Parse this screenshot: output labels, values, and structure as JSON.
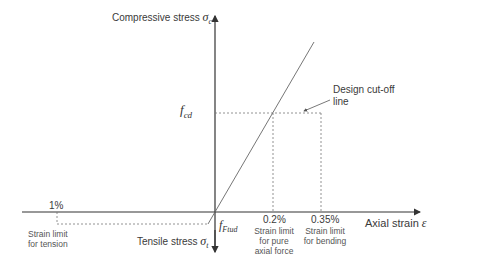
{
  "diagram": {
    "y_axis": {
      "label": "Compressive stress",
      "symbol": "σc",
      "symbol_main": "σ",
      "symbol_sub": "c"
    },
    "y_axis_negative": {
      "label": "Tensile stress",
      "symbol_main": "σ",
      "symbol_sub": "t"
    },
    "x_axis": {
      "label": "Axial strain",
      "symbol": "ε"
    },
    "fcd_label": {
      "main": "f",
      "sub": "cd"
    },
    "fftud_label": {
      "main": "f",
      "sub": "Ftud"
    },
    "annotation": {
      "line1": "Design cut-off",
      "line2": "line"
    },
    "marks": [
      {
        "value": "1%",
        "desc": [
          "Strain limit",
          "for tension"
        ]
      },
      {
        "value": "0.2%",
        "desc": [
          "Strain limit",
          "for pure",
          "axial force"
        ]
      },
      {
        "value": "0.35%",
        "desc": [
          "Strain limit",
          "for bending"
        ]
      }
    ],
    "colors": {
      "axis": "#333333",
      "line": "#666666",
      "dashed": "#777777"
    }
  }
}
